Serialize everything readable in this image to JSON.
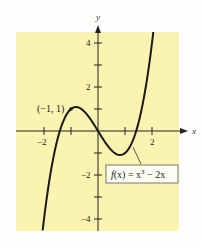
{
  "chart_data": {
    "type": "line",
    "title": "",
    "xlabel": "x",
    "ylabel": "y",
    "xlim": [
      -2.9,
      3.0
    ],
    "ylim": [
      -4.5,
      4.5
    ],
    "grid": false,
    "background_color": "#fbf3b0",
    "x_ticks": [
      -2,
      -1,
      1,
      2
    ],
    "x_tick_labels": [
      "-2",
      "",
      "",
      "2"
    ],
    "y_ticks": [
      -4,
      -3,
      -2,
      -1,
      1,
      2,
      3,
      4
    ],
    "y_tick_labels": [
      "-4",
      "",
      "-2",
      "",
      "",
      "2",
      "",
      "4"
    ],
    "series": [
      {
        "name": "f(x) = x^3 - 2x",
        "function": "x^3 - 2x",
        "x_range": [
          -2.05,
          2.05
        ],
        "color": "#1a1a1a"
      }
    ],
    "annotations": [
      {
        "text": "(−1, 1)",
        "x": -1,
        "y": 1,
        "type": "point"
      },
      {
        "text": "f(x) = x³ − 2x",
        "type": "function-label-box"
      }
    ]
  },
  "labels": {
    "x_axis": "x",
    "y_axis": "y",
    "x_neg2": "−2",
    "x_pos2": "2",
    "y_pos4": "4",
    "y_pos2": "2",
    "y_neg2": "−2",
    "y_neg4": "−4",
    "point": "(−1, 1)",
    "fn_f": "f",
    "fn_x": "(x) = x",
    "fn_exp": "3",
    "fn_rest": " − 2x"
  }
}
